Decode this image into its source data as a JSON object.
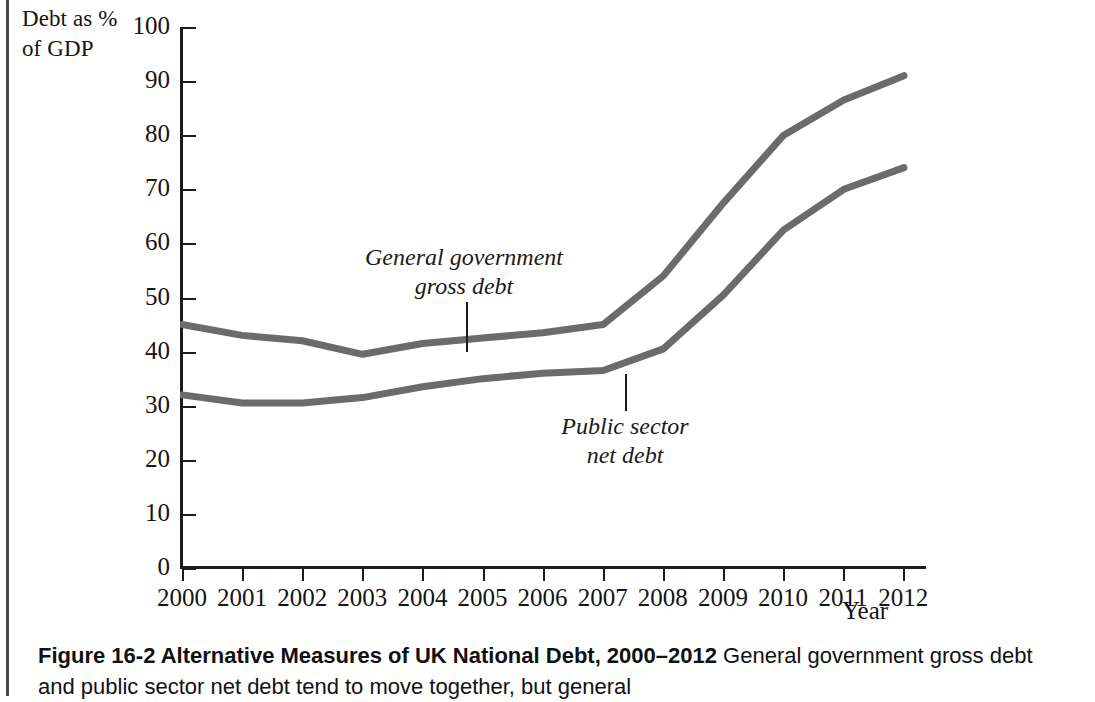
{
  "figure": {
    "caption_title": "Figure 16-2 Alternative Measures of UK National Debt, 2000–2012",
    "caption_body": " General government gross debt and public sector net debt tend to move together, but general"
  },
  "chart_data": {
    "type": "line",
    "title": "",
    "xlabel": "Year",
    "ylabel": "Debt as % of GDP",
    "ylabel_lines": [
      "Debt as %",
      "of GDP"
    ],
    "x": [
      2000,
      2001,
      2002,
      2003,
      2004,
      2005,
      2006,
      2007,
      2008,
      2009,
      2010,
      2011,
      2012
    ],
    "categories": [
      "2000",
      "2001",
      "2002",
      "2003",
      "2004",
      "2005",
      "2006",
      "2007",
      "2008",
      "2009",
      "2010",
      "2011",
      "2012"
    ],
    "yticks": [
      0,
      10,
      20,
      30,
      40,
      50,
      60,
      70,
      80,
      90,
      100
    ],
    "ytick_labels": [
      "0",
      "10",
      "20",
      "30",
      "40",
      "50",
      "60",
      "70",
      "80",
      "90",
      "100"
    ],
    "ylim": [
      0,
      100
    ],
    "xlim": [
      2000,
      2012
    ],
    "grid": false,
    "legend": "none",
    "series": [
      {
        "name": "General government gross debt",
        "color": "#6b6b6b",
        "values": [
          45.0,
          43.0,
          42.0,
          39.5,
          41.5,
          42.5,
          43.5,
          45.0,
          54.0,
          67.5,
          80.0,
          86.5,
          91.0
        ]
      },
      {
        "name": "Public sector net debt",
        "color": "#6b6b6b",
        "values": [
          32.0,
          30.5,
          30.5,
          31.5,
          33.5,
          35.0,
          36.0,
          36.5,
          40.5,
          50.5,
          62.5,
          70.0,
          74.0
        ]
      }
    ],
    "annotations": [
      {
        "id": "gross",
        "lines": [
          "General government",
          "gross debt"
        ],
        "points_to_year": 2004,
        "points_to_value": 41.5
      },
      {
        "id": "net",
        "lines": [
          "Public sector",
          "net debt"
        ],
        "points_to_year": 2007,
        "points_to_value": 36.5
      }
    ],
    "colors": {
      "line": "#6b6b6b",
      "axis": "#1c1c1c",
      "text": "#141414",
      "background": "#ffffff"
    }
  }
}
